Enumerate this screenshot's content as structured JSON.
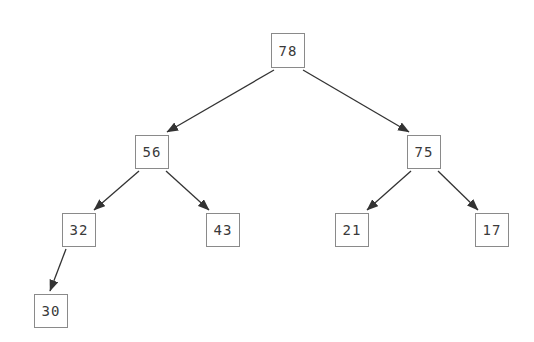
{
  "diagram": {
    "type": "binary-tree",
    "title": "",
    "background_color": "#ffffff",
    "node_border_color": "#8a8a8a",
    "node_fill_color": "#ffffff",
    "node_text_color": "#3a3a3a",
    "edge_color": "#333333",
    "nodes": [
      {
        "id": "n78",
        "label": "78",
        "x": 271,
        "y": 33,
        "w": 34,
        "h": 35,
        "level": 0
      },
      {
        "id": "n56",
        "label": "56",
        "x": 135,
        "y": 135,
        "w": 34,
        "h": 34,
        "level": 1
      },
      {
        "id": "n75",
        "label": "75",
        "x": 407,
        "y": 135,
        "w": 34,
        "h": 34,
        "level": 1
      },
      {
        "id": "n32",
        "label": "32",
        "x": 62,
        "y": 213,
        "w": 34,
        "h": 34,
        "level": 2
      },
      {
        "id": "n43",
        "label": "43",
        "x": 206,
        "y": 213,
        "w": 34,
        "h": 34,
        "level": 2
      },
      {
        "id": "n21",
        "label": "21",
        "x": 335,
        "y": 213,
        "w": 34,
        "h": 34,
        "level": 2
      },
      {
        "id": "n17",
        "label": "17",
        "x": 475,
        "y": 213,
        "w": 34,
        "h": 34,
        "level": 2
      },
      {
        "id": "n30",
        "label": "30",
        "x": 34,
        "y": 294,
        "w": 34,
        "h": 34,
        "level": 3
      }
    ],
    "edges": [
      {
        "id": "e78-56",
        "from": "78",
        "to": "56",
        "side": "left",
        "x1": 274,
        "y1": 70,
        "x2": 167,
        "y2": 132
      },
      {
        "id": "e78-75",
        "from": "78",
        "to": "75",
        "side": "right",
        "x1": 303,
        "y1": 70,
        "x2": 409,
        "y2": 132
      },
      {
        "id": "e56-32",
        "from": "56",
        "to": "32",
        "side": "left",
        "x1": 139,
        "y1": 171,
        "x2": 94,
        "y2": 210
      },
      {
        "id": "e56-43",
        "from": "56",
        "to": "43",
        "side": "right",
        "x1": 166,
        "y1": 171,
        "x2": 209,
        "y2": 210
      },
      {
        "id": "e75-21",
        "from": "75",
        "to": "21",
        "side": "left",
        "x1": 411,
        "y1": 171,
        "x2": 367,
        "y2": 210
      },
      {
        "id": "e75-17",
        "from": "75",
        "to": "17",
        "side": "right",
        "x1": 438,
        "y1": 171,
        "x2": 478,
        "y2": 210
      },
      {
        "id": "e32-30",
        "from": "32",
        "to": "30",
        "side": "left",
        "x1": 66,
        "y1": 249,
        "x2": 50,
        "y2": 291
      }
    ]
  }
}
